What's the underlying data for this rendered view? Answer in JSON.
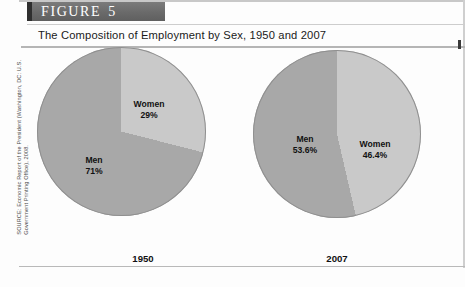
{
  "figure": {
    "band_label": "FIGURE",
    "band_number": "5",
    "subtitle": "The Composition of Employment by Sex, 1950 and 2007",
    "source_line_1": "SOURCE: Economic Report of the President (Washington, DC: U.S.",
    "source_line_2": "Government Printing Office), 2008."
  },
  "colors": {
    "band_background": "#6e6e6e",
    "band_cap": "#2f2f2f",
    "men_wedge": "#a8a8a8",
    "women_wedge": "#c9c9c9",
    "wedge_outline": "#8f8f8f",
    "text": "#111111",
    "rule": "#b5b5b5"
  },
  "chart_data": [
    {
      "type": "pie",
      "title": "1950",
      "year": "1950",
      "categories": [
        "Men",
        "Women"
      ],
      "values": [
        71,
        29
      ],
      "labels": [
        "71%",
        "29%"
      ],
      "legend_position": "inside-slices",
      "slices": [
        {
          "name": "Men",
          "value": 71,
          "label": "71%",
          "color": "#a8a8a8"
        },
        {
          "name": "Women",
          "value": 29,
          "label": "29%",
          "color": "#c9c9c9"
        }
      ]
    },
    {
      "type": "pie",
      "title": "2007",
      "year": "2007",
      "categories": [
        "Men",
        "Women"
      ],
      "values": [
        53.6,
        46.4
      ],
      "labels": [
        "53.6%",
        "46.4%"
      ],
      "legend_position": "inside-slices",
      "slices": [
        {
          "name": "Men",
          "value": 53.6,
          "label": "53.6%",
          "color": "#a8a8a8"
        },
        {
          "name": "Women",
          "value": 46.4,
          "label": "46.4%",
          "color": "#c9c9c9"
        }
      ]
    }
  ]
}
